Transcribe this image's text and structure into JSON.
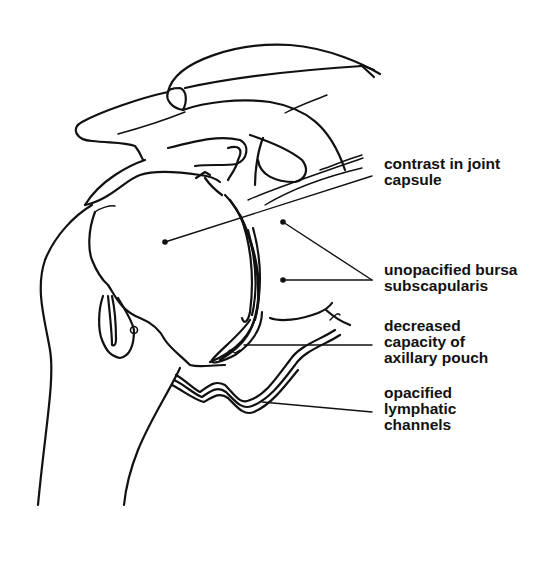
{
  "figure": {
    "type": "anatomical line drawing"
  },
  "labels": [
    {
      "id": "contrast",
      "lines": [
        "contrast in joint",
        "capsule"
      ]
    },
    {
      "id": "bursa",
      "lines": [
        "unopacified bursa",
        "subscapularis"
      ]
    },
    {
      "id": "pouch",
      "lines": [
        "decreased",
        "capacity of",
        "axillary pouch"
      ]
    },
    {
      "id": "lymphatic",
      "lines": [
        "opacified",
        "lymphatic",
        "channels"
      ]
    }
  ],
  "colors": {
    "ink": "#111111",
    "background": "#ffffff"
  }
}
